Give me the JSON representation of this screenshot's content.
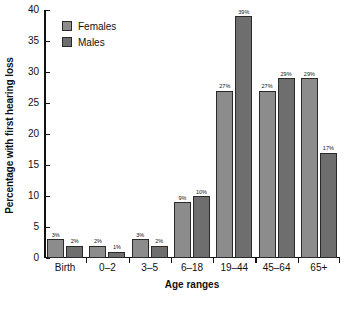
{
  "chart_data": {
    "type": "bar",
    "title": "",
    "subtitle": "",
    "xlabel": "Age ranges",
    "ylabel": "Percentage with first hearing loss",
    "categories": [
      "Birth",
      "0–2",
      "3–5",
      "6–18",
      "19–44",
      "45–64",
      "65+"
    ],
    "series": [
      {
        "name": "Females",
        "color": "#8c8c8c",
        "values": [
          3,
          2,
          3,
          9,
          27,
          27,
          29
        ],
        "value_labels": [
          "3%",
          "2%",
          "3%",
          "9%",
          "27%",
          "27%",
          "29%"
        ]
      },
      {
        "name": "Males",
        "color": "#6e6e6e",
        "values": [
          2,
          1,
          2,
          10,
          39,
          29,
          17
        ],
        "value_labels": [
          "2%",
          "1%",
          "2%",
          "10%",
          "39%",
          "29%",
          "17%"
        ]
      }
    ],
    "ylim": [
      0,
      40
    ],
    "yticks": [
      0,
      5,
      10,
      15,
      20,
      25,
      30,
      35,
      40
    ],
    "ytick_labels": [
      "0",
      "5",
      "10",
      "15",
      "20",
      "25",
      "30",
      "35",
      "40"
    ],
    "grid": false,
    "legend_position": "top-left",
    "value_label_suffix": "%"
  },
  "legend": {
    "entries": [
      {
        "label": "Females",
        "color": "#8c8c8c"
      },
      {
        "label": "Males",
        "color": "#6e6e6e"
      }
    ]
  },
  "axes": {
    "y_title": "Percentage with first hearing loss",
    "x_title": "Age ranges"
  }
}
